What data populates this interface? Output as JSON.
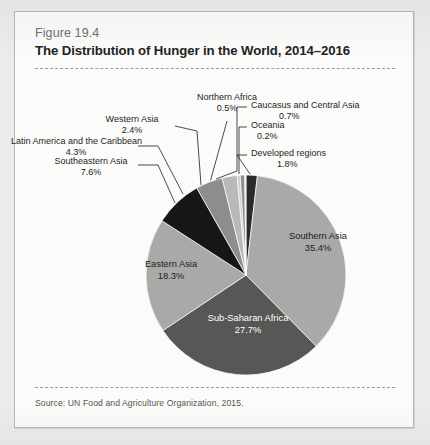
{
  "figure": {
    "number": "Figure 19.4",
    "title": "The Distribution of Hunger in the World, 2014–2016",
    "source": "Source: UN Food and Agriculture Organization, 2015."
  },
  "chart_data": {
    "type": "pie",
    "title": "The Distribution of Hunger in the World, 2014–2016",
    "unit": "percent",
    "legend": "none",
    "labels_inside": [
      "Southern Asia",
      "Sub-Saharan Africa",
      "Eastern Asia"
    ],
    "categories": [
      "Developed regions",
      "Southern Asia",
      "Sub-Saharan Africa",
      "Eastern Asia",
      "Southeastern Asia",
      "Latin America and the Caribbean",
      "Western Asia",
      "Northern Africa",
      "Caucasus and Central Asia",
      "Oceania"
    ],
    "values": [
      1.8,
      35.4,
      27.7,
      18.3,
      7.6,
      4.3,
      2.4,
      0.5,
      0.7,
      0.2
    ],
    "value_labels": [
      "1.8%",
      "35.4%",
      "27.7%",
      "18.3%",
      "7.6%",
      "4.3%",
      "2.4%",
      "0.5%",
      "0.7%",
      "0.2%"
    ],
    "colors": [
      "#2b2b2b",
      "#a9a9a7",
      "#575756",
      "#a9a9a7",
      "#161616",
      "#8d8d8b",
      "#b9b9b7",
      "#cfcfcd",
      "#8d8d8b",
      "#e2e2e0"
    ],
    "start_angle_deg": 0,
    "direction": "clockwise"
  },
  "slices": {
    "developed_regions": {
      "label": "Developed regions",
      "pct": "1.8%"
    },
    "southern_asia": {
      "label": "Southern Asia",
      "pct": "35.4%"
    },
    "sub_saharan_africa": {
      "label": "Sub-Saharan Africa",
      "pct": "27.7%"
    },
    "eastern_asia": {
      "label": "Eastern Asia",
      "pct": "18.3%"
    },
    "southeastern_asia": {
      "label": "Southeastern Asia",
      "pct": "7.6%"
    },
    "latin_america": {
      "label": "Latin America and the Caribbean",
      "pct": "4.3%"
    },
    "western_asia": {
      "label": "Western Asia",
      "pct": "2.4%"
    },
    "northern_africa": {
      "label": "Northern Africa",
      "pct": "0.5%"
    },
    "caucasus_central_asia": {
      "label": "Caucasus and Central Asia",
      "pct": "0.7%"
    },
    "oceania": {
      "label": "Oceania",
      "pct": "0.2%"
    }
  }
}
